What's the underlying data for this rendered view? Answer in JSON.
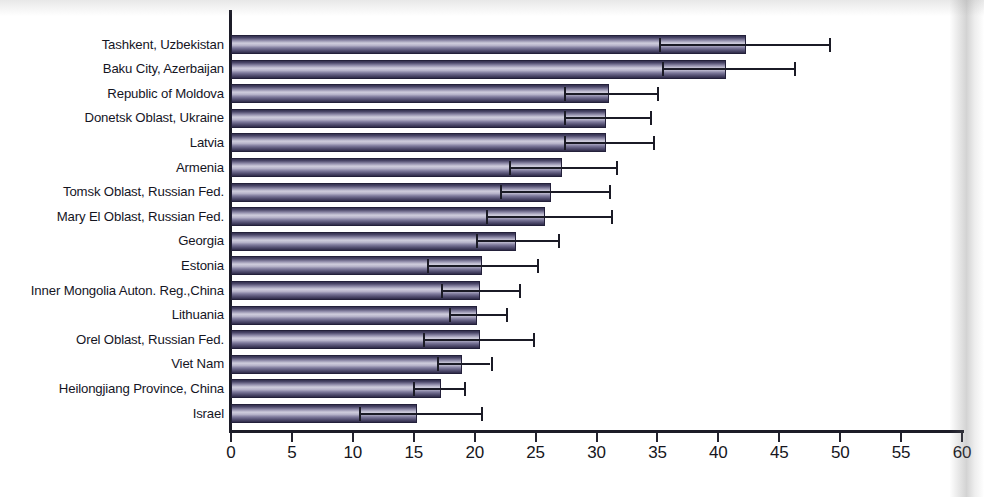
{
  "chart_data": {
    "type": "bar",
    "orientation": "horizontal",
    "title": "",
    "subtitle": "",
    "xlabel": "",
    "ylabel": "",
    "xlim": [
      0,
      60
    ],
    "xticks": [
      0,
      5,
      10,
      15,
      20,
      25,
      30,
      35,
      40,
      45,
      50,
      55,
      60
    ],
    "xtick_labels": [
      "0",
      "5",
      "10",
      "15",
      "20",
      "25",
      "30",
      "35",
      "40",
      "45",
      "50",
      "55",
      "60"
    ],
    "grid": false,
    "legend": false,
    "error_bars": "asymmetric-confidence-interval",
    "bar_color": "#6d6a90",
    "axis_color": "#1c1c28",
    "categories": [
      "Tashkent, Uzbekistan",
      "Baku City, Azerbaijan",
      "Republic of Moldova",
      "Donetsk Oblast, Ukraine",
      "Latvia",
      "Armenia",
      "Tomsk Oblast, Russian Fed.",
      "Mary El Oblast, Russian Fed.",
      "Georgia",
      "Estonia",
      "Inner Mongolia Auton. Reg.,China",
      "Lithuania",
      "Orel Oblast, Russian Fed.",
      "Viet Nam",
      "Heilongjiang Province, China",
      "Israel"
    ],
    "values": [
      42.3,
      40.6,
      31.0,
      30.8,
      30.8,
      27.2,
      26.3,
      25.8,
      23.4,
      20.6,
      20.4,
      20.2,
      20.4,
      19.0,
      17.2,
      15.3
    ],
    "ci_lower": [
      35.1,
      35.4,
      27.3,
      27.3,
      27.3,
      22.8,
      22.1,
      20.9,
      20.1,
      16.1,
      17.2,
      17.9,
      15.8,
      16.9,
      14.9,
      10.5
    ],
    "ci_upper": [
      49.1,
      46.2,
      35.0,
      34.4,
      34.6,
      31.6,
      31.0,
      31.2,
      26.8,
      25.1,
      23.6,
      22.6,
      24.8,
      21.3,
      19.1,
      20.5
    ]
  }
}
